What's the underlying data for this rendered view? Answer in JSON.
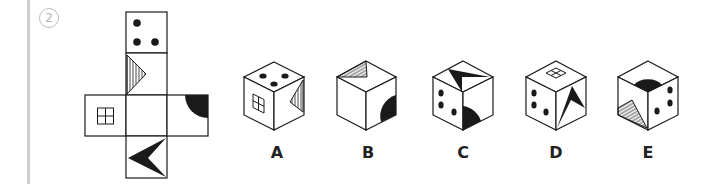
{
  "question": {
    "number": "2",
    "number_display": "②"
  },
  "net": {
    "faces": [
      {
        "id": "top",
        "symbol": "three-dots"
      },
      {
        "id": "upper",
        "symbol": "hatched-triangle"
      },
      {
        "id": "left",
        "symbol": "window-square"
      },
      {
        "id": "center",
        "symbol": "blank"
      },
      {
        "id": "right",
        "symbol": "black-quarter-circle"
      },
      {
        "id": "bottom",
        "symbol": "black-arrowhead"
      }
    ]
  },
  "options": [
    {
      "label": "A",
      "top": "three-dots",
      "left": "window-square",
      "right": "hatched-triangle"
    },
    {
      "label": "B",
      "top": "hatched-triangle",
      "left": "blank",
      "right": "black-quarter-circle"
    },
    {
      "label": "C",
      "top": "black-arrowhead",
      "left": "three-dots",
      "right": "black-quarter-circle"
    },
    {
      "label": "D",
      "top": "window-square",
      "left": "three-dots",
      "right": "black-arrowhead"
    },
    {
      "label": "E",
      "top": "black-quarter-circle",
      "left": "hatched-triangle",
      "right": "three-dots"
    }
  ],
  "colors": {
    "ink": "#1a1a1a",
    "sidebar": "#cfcfcf",
    "qnum": "#b5b5b5"
  }
}
